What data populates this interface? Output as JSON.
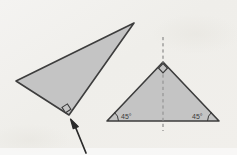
{
  "figure": {
    "background_color": "#f2f2f0",
    "paper_tint": "#eceae6",
    "stroke_color": "#3d3d3d",
    "fill_color": "#c4c4c4",
    "arrow_color": "#2a2a2a",
    "dashed_line_color": "#6e6e6e"
  },
  "shapes": {
    "left_triangle": {
      "name": "scalene-right-triangle",
      "vertices": [
        {
          "label": "apex-right",
          "x": 134,
          "y": 23
        },
        {
          "label": "left",
          "x": 16,
          "y": 81
        },
        {
          "label": "right-angle-vertex",
          "x": 69,
          "y": 115
        }
      ],
      "right_angle_marker": {
        "x": 64,
        "y": 108,
        "size": 7
      }
    },
    "right_triangle": {
      "name": "isosceles-right-triangle",
      "vertices": [
        {
          "label": "apex",
          "x": 163,
          "y": 62
        },
        {
          "label": "base-left",
          "x": 107,
          "y": 121
        },
        {
          "label": "base-right",
          "x": 219,
          "y": 121
        }
      ],
      "right_angle_marker": {
        "x": 163,
        "y": 68,
        "size": 7
      },
      "axis_of_symmetry": {
        "x": 163,
        "y_top": 37,
        "y_bottom": 131,
        "style": "dashed"
      }
    }
  },
  "labels": {
    "left_base_angle": "45°",
    "right_base_angle": "45°"
  },
  "annotations": {
    "pointer_arrow": {
      "name": "callout-arrow",
      "tip": {
        "x": 72,
        "y": 120
      },
      "tail": {
        "x": 86,
        "y": 153
      },
      "points_to": "right-angle-vertex of left triangle"
    }
  }
}
